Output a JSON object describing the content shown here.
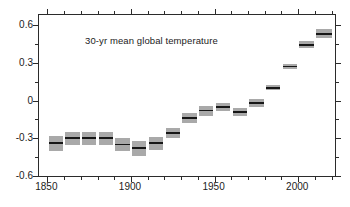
{
  "chart_data": {
    "type": "bar",
    "title": "30-yr mean global temperature",
    "xlabel": "",
    "ylabel": "",
    "xlim": [
      1845,
      2022
    ],
    "ylim": [
      -0.6,
      0.68
    ],
    "grid": false,
    "legend": null,
    "y_ticks": [
      0.6,
      0.3,
      0,
      -0.3,
      -0.6
    ],
    "y_tick_labels": [
      "0.6",
      "0.3",
      "0",
      "-0.3",
      "-0.6"
    ],
    "y_minor_ticks": [
      0.45,
      0.15,
      -0.15,
      -0.45
    ],
    "x_ticks": [
      1850,
      1900,
      1950,
      2000
    ],
    "x_tick_labels": [
      "1850",
      "1900",
      "1950",
      "2000"
    ],
    "x_minor_ticks": [
      1860,
      1870,
      1880,
      1890,
      1910,
      1920,
      1930,
      1940,
      1960,
      1970,
      1980,
      1990,
      2010,
      2020
    ],
    "series_name": "30-yr mean global temperature anomaly",
    "bar_color": "#161616",
    "band_color": "#a9a9a9",
    "axis_color": "#2b2b2b",
    "bars": [
      {
        "x_start": 1850,
        "x_end": 1860,
        "value": -0.34,
        "low": -0.4,
        "high": -0.28
      },
      {
        "x_start": 1860,
        "x_end": 1870,
        "value": -0.3,
        "low": -0.35,
        "high": -0.25
      },
      {
        "x_start": 1870,
        "x_end": 1880,
        "value": -0.3,
        "low": -0.35,
        "high": -0.25
      },
      {
        "x_start": 1880,
        "x_end": 1890,
        "value": -0.3,
        "low": -0.35,
        "high": -0.25
      },
      {
        "x_start": 1890,
        "x_end": 1900,
        "value": -0.35,
        "low": -0.4,
        "high": -0.3
      },
      {
        "x_start": 1900,
        "x_end": 1910,
        "value": -0.38,
        "low": -0.44,
        "high": -0.32
      },
      {
        "x_start": 1910,
        "x_end": 1920,
        "value": -0.34,
        "low": -0.39,
        "high": -0.29
      },
      {
        "x_start": 1920,
        "x_end": 1930,
        "value": -0.26,
        "low": -0.3,
        "high": -0.22
      },
      {
        "x_start": 1930,
        "x_end": 1940,
        "value": -0.14,
        "low": -0.18,
        "high": -0.1
      },
      {
        "x_start": 1940,
        "x_end": 1950,
        "value": -0.08,
        "low": -0.12,
        "high": -0.04
      },
      {
        "x_start": 1950,
        "x_end": 1960,
        "value": -0.05,
        "low": -0.08,
        "high": -0.02
      },
      {
        "x_start": 1960,
        "x_end": 1970,
        "value": -0.09,
        "low": -0.12,
        "high": -0.06
      },
      {
        "x_start": 1970,
        "x_end": 1980,
        "value": -0.02,
        "low": -0.05,
        "high": 0.01
      },
      {
        "x_start": 1980,
        "x_end": 1990,
        "value": 0.1,
        "low": 0.08,
        "high": 0.12
      },
      {
        "x_start": 1990,
        "x_end": 2000,
        "value": 0.27,
        "low": 0.25,
        "high": 0.29
      },
      {
        "x_start": 2000,
        "x_end": 2010,
        "value": 0.44,
        "low": 0.42,
        "high": 0.47
      },
      {
        "x_start": 2010,
        "x_end": 2021,
        "value": 0.53,
        "low": 0.5,
        "high": 0.57
      }
    ]
  }
}
